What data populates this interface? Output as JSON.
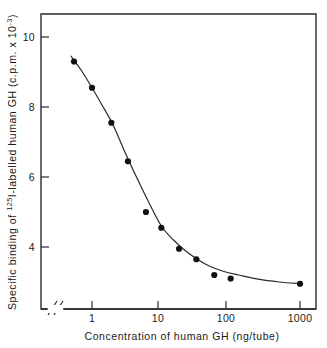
{
  "figure": {
    "title": "",
    "background_color": "#ffffff",
    "ink_color": "#1a1a1a"
  },
  "yaxis": {
    "label_part1": "Specific binding of",
    "label_sup": "125",
    "label_part2": "I-labelled human GH",
    "label_part3": "(c.p.m. x 10",
    "label_sup2": "-3",
    "label_part4": ")",
    "full_label": "Specific binding of 125I-labelled human GH (c.p.m. x 10-3)",
    "ticks": [
      "10",
      "8",
      "6",
      "4"
    ],
    "tick_values": [
      10,
      8,
      6,
      4
    ]
  },
  "xaxis": {
    "label": "Concentration of human GH  (ng/tube)",
    "ticks": [
      "1",
      "10",
      "100",
      "1000"
    ],
    "tick_values": [
      1,
      10,
      100,
      1000
    ],
    "has_axis_break": true,
    "break_symbol": "//"
  },
  "chart_data": {
    "type": "scatter",
    "title": "",
    "xlabel": "Concentration of human GH  (ng/tube)",
    "ylabel": "Specific binding of 125I-labelled human GH (c.p.m. x 10-3)",
    "xscale": "log",
    "yscale": "linear",
    "xlim": [
      0.42,
      1800
    ],
    "ylim": [
      2.3,
      10.8
    ],
    "grid": false,
    "legend": false,
    "xticks": [
      1,
      10,
      100,
      1000
    ],
    "yticks": [
      10,
      8,
      6,
      4
    ],
    "series": [
      {
        "name": "Specific binding",
        "marker": "filled-circle",
        "marker_color": "#111111",
        "x": [
          0.55,
          1.0,
          1.9,
          3.3,
          6.0,
          10.0,
          18.0,
          32.0,
          58.0,
          100.0,
          1000.0
        ],
        "y": [
          9.3,
          8.55,
          7.55,
          6.45,
          5.0,
          4.55,
          3.95,
          3.65,
          3.2,
          3.1,
          2.95
        ]
      }
    ],
    "fit_curve": {
      "name": "fitted sigmoid standard curve",
      "color": "#2b2b2b",
      "x": [
        0.5,
        0.7,
        1.0,
        1.4,
        2.0,
        3.0,
        4.5,
        6.5,
        10.0,
        15.0,
        22.0,
        33.0,
        50.0,
        80.0,
        130.0,
        250.0,
        500.0,
        1000.0
      ],
      "y": [
        9.45,
        9.05,
        8.55,
        8.05,
        7.5,
        6.7,
        5.95,
        5.3,
        4.6,
        4.2,
        3.9,
        3.65,
        3.45,
        3.3,
        3.2,
        3.08,
        3.0,
        2.95
      ]
    }
  }
}
